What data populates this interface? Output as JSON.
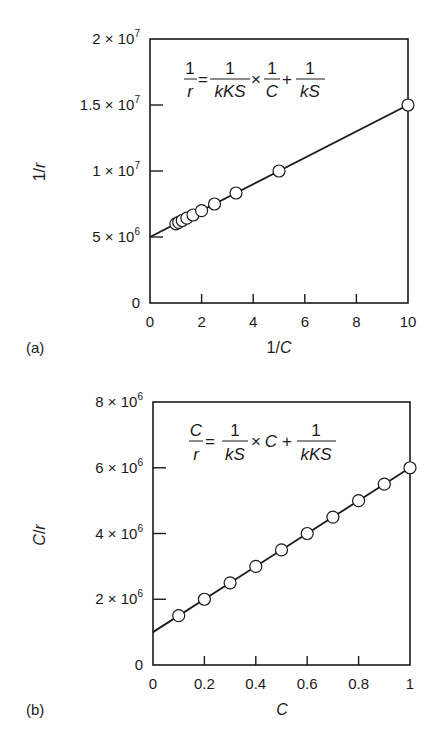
{
  "figure": {
    "panels": [
      {
        "label": "(a)",
        "equation": {
          "lhs_num": "1",
          "lhs_den": "r",
          "t1_num": "1",
          "t1_den": "kKS",
          "times": "×",
          "t2_num": "1",
          "t2_den": "C",
          "plus": "+",
          "t3_num": "1",
          "t3_den": "kS"
        },
        "xlabel_pre": "1/",
        "xlabel_var": "C",
        "ylabel": "1/r",
        "x_ticks": [
          "0",
          "2",
          "4",
          "6",
          "8",
          "10"
        ],
        "y_ticks": [
          {
            "mant": "0",
            "exp": ""
          },
          {
            "mant": "5 × 10",
            "exp": "6"
          },
          {
            "mant": "1 × 10",
            "exp": "7"
          },
          {
            "mant": "1.5 × 10",
            "exp": "7"
          },
          {
            "mant": "2 × 10",
            "exp": "7"
          }
        ]
      },
      {
        "label": "(b)",
        "equation": {
          "lhs_num": "C",
          "lhs_den": "r",
          "t1_num": "1",
          "t1_den": "kS",
          "times": "×",
          "t2": "C",
          "plus": "+",
          "t3_num": "1",
          "t3_den": "kKS"
        },
        "xlabel_var": "C",
        "ylabel": "C/r",
        "x_ticks": [
          "0",
          "0.2",
          "0.4",
          "0.6",
          "0.8",
          "1"
        ],
        "y_ticks": [
          {
            "mant": "0",
            "exp": ""
          },
          {
            "mant": "2 × 10",
            "exp": "6"
          },
          {
            "mant": "4 × 10",
            "exp": "6"
          },
          {
            "mant": "6 × 10",
            "exp": "6"
          },
          {
            "mant": "8 × 10",
            "exp": "6"
          }
        ]
      }
    ]
  },
  "chart_data": [
    {
      "type": "scatter",
      "title": "(a) Lineweaver-Burk style plot",
      "annotation": "1/r = 1/(kKS) × 1/C + 1/(kS)",
      "xlabel": "1/C",
      "ylabel": "1/r",
      "xlim": [
        0,
        10
      ],
      "ylim": [
        0,
        20000000
      ],
      "x_ticks": [
        0,
        2,
        4,
        6,
        8,
        10
      ],
      "y_ticks": [
        0,
        5000000,
        10000000,
        15000000,
        20000000
      ],
      "grid": false,
      "series": [
        {
          "name": "data",
          "marker": "open-circle",
          "x": [
            1.0,
            1.111,
            1.25,
            1.429,
            1.667,
            2.0,
            2.5,
            3.333,
            5.0,
            10.0
          ],
          "y": [
            6000000,
            6111111,
            6250000,
            6428571,
            6666667,
            7000000,
            7500000,
            8333333,
            10000000,
            15000000
          ]
        },
        {
          "name": "fit",
          "type": "line",
          "x": [
            0,
            10
          ],
          "y": [
            5000000,
            15000000
          ]
        }
      ]
    },
    {
      "type": "scatter",
      "title": "(b) Hanes-Woolf style plot",
      "annotation": "C/r = 1/(kS) × C + 1/(kKS)",
      "xlabel": "C",
      "ylabel": "C/r",
      "xlim": [
        0,
        1
      ],
      "ylim": [
        0,
        8000000
      ],
      "x_ticks": [
        0,
        0.2,
        0.4,
        0.6,
        0.8,
        1
      ],
      "y_ticks": [
        0,
        2000000,
        4000000,
        6000000,
        8000000
      ],
      "grid": false,
      "series": [
        {
          "name": "data",
          "marker": "open-circle",
          "x": [
            0.1,
            0.2,
            0.3,
            0.4,
            0.5,
            0.6,
            0.7,
            0.8,
            0.9,
            1.0
          ],
          "y": [
            1500000,
            2000000,
            2500000,
            3000000,
            3500000,
            4000000,
            4500000,
            5000000,
            5500000,
            6000000
          ]
        },
        {
          "name": "fit",
          "type": "line",
          "x": [
            0,
            1
          ],
          "y": [
            1000000,
            6000000
          ]
        }
      ]
    }
  ]
}
